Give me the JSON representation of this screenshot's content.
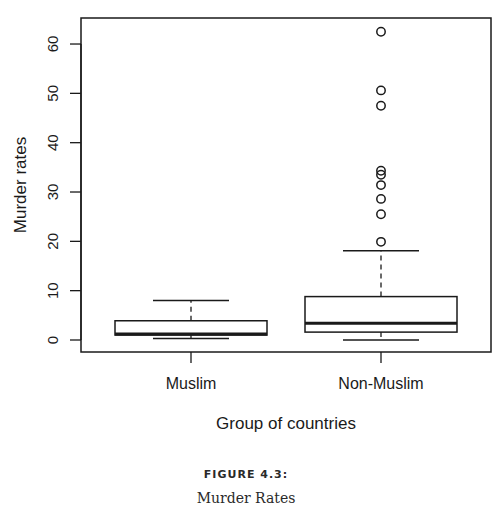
{
  "chart_data": {
    "type": "box",
    "title": "",
    "xlabel": "Group of countries",
    "ylabel": "Murder rates",
    "ylim": [
      0,
      62.5
    ],
    "yticks": [
      0,
      10,
      20,
      30,
      40,
      50,
      60
    ],
    "categories": [
      "Muslim",
      "Non-Muslim"
    ],
    "grid": false,
    "series": [
      {
        "name": "Muslim",
        "whisker_low": 0.3,
        "q1": 1.0,
        "median": 1.2,
        "q3": 3.9,
        "whisker_high": 8.0,
        "outliers": []
      },
      {
        "name": "Non-Muslim",
        "whisker_low": 0.0,
        "q1": 1.6,
        "median": 3.4,
        "q3": 8.8,
        "whisker_high": 18.1,
        "outliers": [
          62.5,
          50.6,
          47.5,
          34.3,
          33.5,
          31.4,
          28.6,
          25.5,
          19.9
        ]
      }
    ]
  },
  "caption": {
    "label": "FIGURE 4.3:",
    "title": "Murder Rates"
  },
  "style": {
    "line_color": "#1a1a1a",
    "background": "#ffffff"
  }
}
